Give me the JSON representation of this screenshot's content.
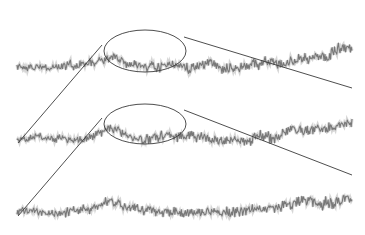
{
  "diagram": {
    "kind": "self-similar time series magnification",
    "colors": {
      "series": "#6e6e6e",
      "series_halo": "#b5b5b5",
      "annotation": "#3a3a3a",
      "background": "#ffffff"
    },
    "series": [
      {
        "id": "level-1",
        "x_start": 17,
        "x_end": 352,
        "baseline_y": 66,
        "trend_rise": 30,
        "amplitude": 9,
        "seed": 7
      },
      {
        "id": "level-2",
        "x_start": 17,
        "x_end": 352,
        "baseline_y": 138,
        "trend_rise": 30,
        "amplitude": 9,
        "seed": 21
      },
      {
        "id": "level-3",
        "x_start": 17,
        "x_end": 352,
        "baseline_y": 212,
        "trend_rise": 30,
        "amplitude": 9,
        "seed": 42
      }
    ],
    "highlights": [
      {
        "id": "ellipse-1",
        "cx": 145,
        "cy": 51,
        "rx": 41,
        "ry": 21
      },
      {
        "id": "ellipse-2",
        "cx": 145,
        "cy": 124,
        "rx": 41,
        "ry": 20
      }
    ],
    "connectors": [
      {
        "id": "connector-1-left",
        "x1": 102,
        "y1": 45,
        "x2": 18,
        "y2": 143
      },
      {
        "id": "connector-1-right",
        "x1": 184,
        "y1": 37,
        "x2": 352,
        "y2": 88
      },
      {
        "id": "connector-2-left",
        "x1": 102,
        "y1": 118,
        "x2": 18,
        "y2": 216
      },
      {
        "id": "connector-2-right",
        "x1": 184,
        "y1": 110,
        "x2": 352,
        "y2": 175
      }
    ]
  }
}
